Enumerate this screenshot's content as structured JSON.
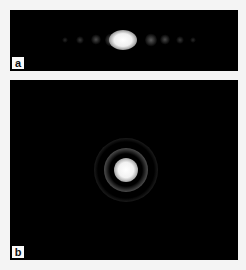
{
  "panels": [
    {
      "id": "a",
      "label": "a",
      "pattern": "single-slit diffraction"
    },
    {
      "id": "b",
      "label": "b",
      "pattern": "circular aperture (Airy) diffraction"
    }
  ],
  "colors": {
    "background": "#f4f4f4",
    "panel": "#000000",
    "label_bg": "#fafafa"
  }
}
